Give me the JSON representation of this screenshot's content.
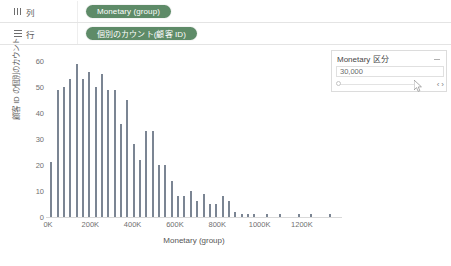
{
  "shelves": {
    "columns": {
      "label": "列",
      "icon": "columns-icon",
      "pill": "Monetary (group)"
    },
    "rows": {
      "label": "行",
      "icon": "rows-icon",
      "pill": "個別のカウント(顧客 ID)"
    }
  },
  "filter_card": {
    "title": "Monetary 区分",
    "value": "30,000",
    "menu_icon": "card-menu-icon",
    "prev_label": "‹",
    "next_label": "›",
    "cursor_icon": "mouse-cursor-icon"
  },
  "colors": {
    "pill_green": "#5e8b68",
    "bar_gray": "#7b8593",
    "axis_text": "#707070",
    "card_border": "#dcdcdc"
  },
  "chart_data": {
    "type": "bar",
    "title": "",
    "xlabel": "Monetary (group)",
    "ylabel": "顧客 ID の個別のカウント",
    "xlim": [
      0,
      1380000
    ],
    "ylim": [
      0,
      62
    ],
    "ytick_values": [
      0,
      10,
      20,
      30,
      40,
      50,
      60
    ],
    "ytick_labels": [
      "0",
      "10",
      "20",
      "30",
      "40",
      "50",
      "60"
    ],
    "xtick_values": [
      0,
      200000,
      400000,
      600000,
      800000,
      1000000,
      1200000
    ],
    "xtick_labels": [
      "0K",
      "200K",
      "400K",
      "600K",
      "800K",
      "1000K",
      "1200K"
    ],
    "grid": false,
    "legend": false,
    "bin_width": 30000,
    "x": [
      15000,
      45000,
      75000,
      105000,
      135000,
      165000,
      195000,
      225000,
      255000,
      285000,
      315000,
      345000,
      375000,
      405000,
      435000,
      465000,
      495000,
      525000,
      555000,
      585000,
      615000,
      645000,
      675000,
      705000,
      735000,
      765000,
      795000,
      825000,
      855000,
      885000,
      915000,
      945000,
      975000,
      1005000,
      1035000,
      1065000,
      1095000,
      1125000,
      1155000,
      1185000,
      1215000,
      1245000,
      1275000,
      1305000,
      1335000
    ],
    "values": [
      21,
      49,
      50,
      53,
      59,
      53,
      56,
      50,
      55,
      49,
      49,
      36,
      45,
      28,
      22,
      33,
      33,
      20,
      20,
      14,
      8,
      8,
      10,
      6,
      9,
      5,
      5,
      8,
      6,
      2,
      1,
      1,
      1,
      0,
      1,
      0,
      1,
      0,
      0,
      1,
      0,
      1,
      0,
      0,
      1
    ],
    "series": [
      {
        "name": "個別のカウント(顧客 ID)",
        "values": [
          21,
          49,
          50,
          53,
          59,
          53,
          56,
          50,
          55,
          49,
          49,
          36,
          45,
          28,
          22,
          33,
          33,
          20,
          20,
          14,
          8,
          8,
          10,
          6,
          9,
          5,
          5,
          8,
          6,
          2,
          1,
          1,
          1,
          0,
          1,
          0,
          1,
          0,
          0,
          1,
          0,
          1,
          0,
          0,
          1
        ]
      }
    ]
  }
}
